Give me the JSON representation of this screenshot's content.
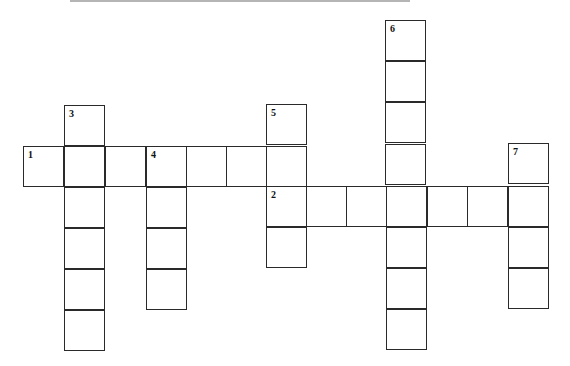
{
  "puzzle": {
    "type": "crossword",
    "cell_size": 41,
    "cells": [
      {
        "x": 23,
        "y": 146,
        "num": "1"
      },
      {
        "x": 64,
        "y": 146,
        "num": ""
      },
      {
        "x": 105,
        "y": 146,
        "num": ""
      },
      {
        "x": 146,
        "y": 146,
        "num": "4"
      },
      {
        "x": 186,
        "y": 146,
        "num": ""
      },
      {
        "x": 226,
        "y": 146,
        "num": ""
      },
      {
        "x": 266,
        "y": 146,
        "num": ""
      },
      {
        "x": 64,
        "y": 105,
        "num": "3"
      },
      {
        "x": 64,
        "y": 187,
        "num": ""
      },
      {
        "x": 64,
        "y": 228,
        "num": ""
      },
      {
        "x": 64,
        "y": 269,
        "num": ""
      },
      {
        "x": 64,
        "y": 310,
        "num": ""
      },
      {
        "x": 146,
        "y": 187,
        "num": ""
      },
      {
        "x": 146,
        "y": 228,
        "num": ""
      },
      {
        "x": 146,
        "y": 269,
        "num": ""
      },
      {
        "x": 266,
        "y": 104,
        "num": "5"
      },
      {
        "x": 266,
        "y": 186,
        "num": "2"
      },
      {
        "x": 266,
        "y": 227,
        "num": ""
      },
      {
        "x": 306,
        "y": 186,
        "num": ""
      },
      {
        "x": 346,
        "y": 186,
        "num": ""
      },
      {
        "x": 386,
        "y": 186,
        "num": ""
      },
      {
        "x": 427,
        "y": 186,
        "num": ""
      },
      {
        "x": 467,
        "y": 186,
        "num": ""
      },
      {
        "x": 508,
        "y": 186,
        "num": ""
      },
      {
        "x": 385,
        "y": 20,
        "num": "6"
      },
      {
        "x": 385,
        "y": 61,
        "num": ""
      },
      {
        "x": 385,
        "y": 102,
        "num": ""
      },
      {
        "x": 385,
        "y": 144,
        "num": ""
      },
      {
        "x": 386,
        "y": 227,
        "num": ""
      },
      {
        "x": 386,
        "y": 268,
        "num": ""
      },
      {
        "x": 386,
        "y": 309,
        "num": ""
      },
      {
        "x": 508,
        "y": 143,
        "num": "7"
      },
      {
        "x": 508,
        "y": 227,
        "num": ""
      },
      {
        "x": 508,
        "y": 268,
        "num": ""
      }
    ],
    "clues": {
      "across": [
        "1",
        "2"
      ],
      "down": [
        "3",
        "4",
        "5",
        "6",
        "7"
      ]
    }
  }
}
